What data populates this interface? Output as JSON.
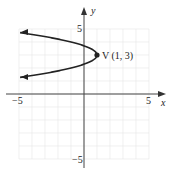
{
  "chart_data": {
    "type": "line",
    "title": "",
    "xlabel": "x",
    "ylabel": "y",
    "xlim": [
      -5,
      5
    ],
    "ylim": [
      -5,
      5
    ],
    "grid": true,
    "x_ticks_labeled": [
      "-5",
      "5"
    ],
    "y_ticks_labeled": [
      "5",
      "-5"
    ],
    "series": [
      {
        "name": "parabola x = -2(y-3)^2 + 1",
        "equation": "x = -2(y-3)^2 + 1",
        "points": [
          [
            -4.8,
            4.7
          ],
          [
            -3.5,
            4.5
          ],
          [
            -1,
            4
          ],
          [
            0.5,
            3.5
          ],
          [
            1,
            3
          ],
          [
            0.5,
            2.5
          ],
          [
            -1,
            2
          ],
          [
            -3.5,
            1.5
          ],
          [
            -4.8,
            1.3
          ]
        ]
      }
    ],
    "annotations": [
      {
        "text": "V (1, 3)",
        "x": 1,
        "y": 3,
        "marker": "point"
      }
    ]
  },
  "labels": {
    "x_axis": "x",
    "y_axis": "y",
    "x_min": "−5",
    "x_max": "5",
    "y_max": "5",
    "y_min": "−5",
    "vertex": "V (1, 3)"
  }
}
